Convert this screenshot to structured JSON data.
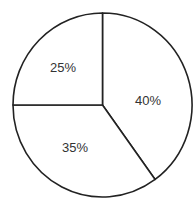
{
  "chart_data": {
    "type": "pie",
    "title": "",
    "categories": [
      "40%",
      "35%",
      "25%"
    ],
    "values": [
      40,
      35,
      25
    ],
    "labels": [
      "40%",
      "35%",
      "25%"
    ],
    "start_angle_deg": 0,
    "direction": "clockwise",
    "legend": "none",
    "colors": [
      "#ffffff",
      "#ffffff",
      "#ffffff"
    ],
    "stroke_color": "#222222"
  },
  "layout": {
    "cx": 102.5,
    "cy": 105,
    "rx": 89.5,
    "ry": 92,
    "label_positions": [
      [
        148,
        100
      ],
      [
        75,
        147
      ],
      [
        63,
        67
      ]
    ]
  }
}
